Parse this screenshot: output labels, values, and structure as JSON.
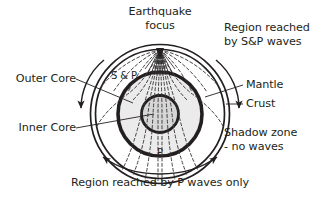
{
  "diagram": {
    "labels": {
      "focus_line1": "Earthquake",
      "focus_line2": "focus",
      "region_sp_line1": "Region reached",
      "region_sp_line2": "by S&P waves",
      "mantle": "Mantle",
      "crust": "Crust",
      "shadow_line1": "Shadow zone",
      "shadow_line2": "- no waves",
      "outer_core": "Outer Core",
      "inner_core": "Inner Core",
      "caption": "Region reached by P waves only",
      "wave_sp": "S & P",
      "wave_p": "P"
    },
    "colors": {
      "stroke": "#231f20",
      "text": "#231f20",
      "background": "#ffffff",
      "mantle_fill": "#ffffff",
      "outer_core_fill": "#ebebeb",
      "inner_core_fill": "#d6d6d6",
      "ray_stroke": "#3a3a3a"
    },
    "geometry": {
      "center_x": 160,
      "center_y": 114,
      "crust_outer_radius": 72,
      "crust_inner_radius": 67,
      "mantle_inner_radius": 46,
      "outer_core_radius": 41,
      "inner_core_radius": 18,
      "focus_x": 160,
      "focus_y": 48
    }
  }
}
